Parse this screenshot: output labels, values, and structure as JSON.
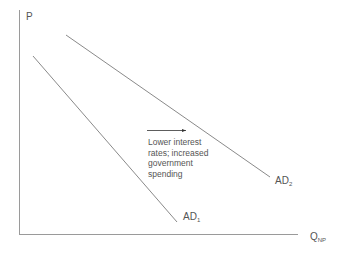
{
  "diagram": {
    "type": "aggregate-demand-shift",
    "axes": {
      "y_label": "P",
      "x_label_main": "Q",
      "x_label_sub": "NP"
    },
    "curves": [
      {
        "label_main": "AD",
        "label_sub": "1",
        "from": [
          33,
          56
        ],
        "to": [
          177,
          222
        ]
      },
      {
        "label_main": "AD",
        "label_sub": "2",
        "from": [
          66,
          35
        ],
        "to": [
          270,
          177
        ]
      }
    ],
    "shift_arrow": {
      "direction": "right",
      "annotation": [
        "Lower interest",
        "rates; increased",
        "government",
        "spending"
      ]
    },
    "colors": {
      "axis": "#9a9a9a",
      "curve": "#8a8a8a",
      "text": "#555555",
      "arrow": "#333333"
    }
  }
}
